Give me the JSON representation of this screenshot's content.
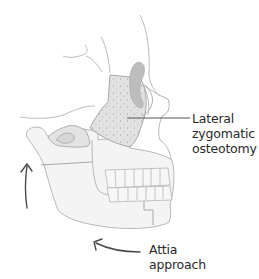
{
  "figure": {
    "colors": {
      "outline": "#b8b8b8",
      "bone_fill": "#f3f3f3",
      "osteotomy_fill": "#dedede",
      "orbit_shadow": "#b5b5b5",
      "stipple": "#8f8f8f",
      "leader_line": "#555555",
      "arrow": "#4a4a4a",
      "text": "#2a2a2a"
    }
  },
  "labels": {
    "lateral_zygomatic_osteotomy": {
      "lines": [
        "Lateral",
        "zygomatic",
        "osteotomy"
      ]
    },
    "attia_approach": {
      "lines": [
        "Attia",
        "approach"
      ]
    }
  },
  "arrows": {
    "vertical_arrow": {
      "direction": "up",
      "icon": "curved-arrow-up"
    },
    "attia_arrow": {
      "direction": "left",
      "icon": "curved-arrow-left"
    }
  }
}
